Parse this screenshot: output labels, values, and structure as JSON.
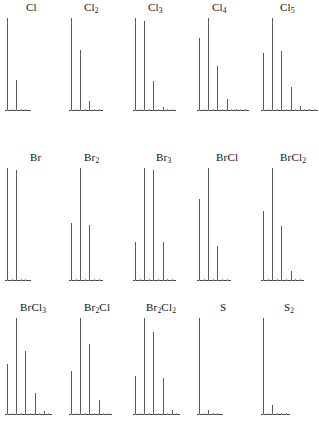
{
  "figure": {
    "title_visible": false,
    "panel_count": 15,
    "grid": {
      "rows": 3,
      "columns": 5
    }
  },
  "chart_data": {
    "type": "bar",
    "title": "",
    "subtitle": "",
    "xlabel": "",
    "ylabel": "",
    "grid": false,
    "legend": "none",
    "axis_ranges": {
      "y": [
        0,
        100
      ]
    },
    "panels": [
      {
        "label": "Cl",
        "label_formula": "Cl",
        "row": 0,
        "column": 0,
        "categories": [
          "M",
          "M+2"
        ],
        "values": [
          100,
          33
        ],
        "stick_positions": [
          0,
          2
        ],
        "axis_ticks": 5
      },
      {
        "label": "Cl2",
        "label_formula": "Cl₂",
        "row": 0,
        "column": 1,
        "categories": [
          "M",
          "M+2",
          "M+4"
        ],
        "values": [
          100,
          65,
          10
        ],
        "stick_positions": [
          0,
          2,
          4
        ],
        "axis_ticks": 7
      },
      {
        "label": "Cl3",
        "label_formula": "Cl₃",
        "row": 0,
        "column": 2,
        "categories": [
          "M",
          "M+2",
          "M+4",
          "M+6"
        ],
        "values": [
          100,
          97,
          32,
          3
        ],
        "stick_positions": [
          0,
          2,
          4,
          6
        ],
        "axis_ticks": 9
      },
      {
        "label": "Cl4",
        "label_formula": "Cl₄",
        "row": 0,
        "column": 3,
        "categories": [
          "M",
          "M+2",
          "M+4",
          "M+6",
          "M+8"
        ],
        "values": [
          78,
          100,
          48,
          12,
          1
        ],
        "stick_positions": [
          0,
          2,
          4,
          6,
          8
        ],
        "axis_ticks": 11
      },
      {
        "label": "Cl5",
        "label_formula": "Cl₅",
        "row": 0,
        "column": 4,
        "categories": [
          "M",
          "M+2",
          "M+4",
          "M+6",
          "M+8",
          "M+10"
        ],
        "values": [
          62,
          100,
          64,
          25,
          4,
          1
        ],
        "stick_positions": [
          0,
          2,
          4,
          6,
          8,
          10
        ],
        "axis_ticks": 12
      },
      {
        "label": "Br",
        "label_formula": "Br",
        "row": 1,
        "column": 0,
        "categories": [
          "M",
          "M+2"
        ],
        "values": [
          100,
          98
        ],
        "stick_positions": [
          0,
          2
        ],
        "axis_ticks": 5
      },
      {
        "label": "Br2",
        "label_formula": "Br₂",
        "row": 1,
        "column": 1,
        "categories": [
          "M",
          "M+2",
          "M+4"
        ],
        "values": [
          51,
          100,
          49
        ],
        "stick_positions": [
          0,
          2,
          4
        ],
        "axis_ticks": 7
      },
      {
        "label": "Br3",
        "label_formula": "Br₃",
        "row": 1,
        "column": 2,
        "categories": [
          "M",
          "M+2",
          "M+4",
          "M+6"
        ],
        "values": [
          34,
          100,
          98,
          34
        ],
        "stick_positions": [
          0,
          2,
          4,
          6
        ],
        "axis_ticks": 9
      },
      {
        "label": "BrCl",
        "label_formula": "BrCl",
        "row": 1,
        "column": 3,
        "categories": [
          "M",
          "M+2",
          "M+4"
        ],
        "values": [
          72,
          100,
          30
        ],
        "stick_positions": [
          0,
          2,
          4
        ],
        "axis_ticks": 7
      },
      {
        "label": "BrCl2",
        "label_formula": "BrCl₂",
        "row": 1,
        "column": 4,
        "categories": [
          "M",
          "M+2",
          "M+4",
          "M+6"
        ],
        "values": [
          62,
          100,
          48,
          8
        ],
        "stick_positions": [
          0,
          2,
          4,
          6
        ],
        "axis_ticks": 9
      },
      {
        "label": "BrCl3",
        "label_formula": "BrCl₃",
        "row": 2,
        "column": 0,
        "categories": [
          "M",
          "M+2",
          "M+4",
          "M+6",
          "M+8"
        ],
        "values": [
          52,
          100,
          66,
          22,
          3
        ],
        "stick_positions": [
          0,
          2,
          4,
          6,
          8
        ],
        "axis_ticks": 10
      },
      {
        "label": "Br2Cl",
        "label_formula": "Br₂Cl",
        "row": 2,
        "column": 1,
        "categories": [
          "M",
          "M+2",
          "M+4",
          "M+6"
        ],
        "values": [
          45,
          100,
          73,
          15
        ],
        "stick_positions": [
          0,
          2,
          4,
          6
        ],
        "axis_ticks": 9
      },
      {
        "label": "Br2Cl2",
        "label_formula": "Br₂Cl₂",
        "row": 2,
        "column": 2,
        "categories": [
          "M",
          "M+2",
          "M+4",
          "M+6",
          "M+8"
        ],
        "values": [
          40,
          100,
          85,
          38,
          4
        ],
        "stick_positions": [
          0,
          2,
          4,
          6,
          8
        ],
        "axis_ticks": 10
      },
      {
        "label": "S",
        "label_formula": "S",
        "row": 2,
        "column": 3,
        "categories": [
          "M",
          "M+2"
        ],
        "values": [
          100,
          4
        ],
        "stick_positions": [
          0,
          2
        ],
        "axis_ticks": 5
      },
      {
        "label": "S2",
        "label_formula": "S₂",
        "row": 2,
        "column": 4,
        "categories": [
          "M",
          "M+2"
        ],
        "values": [
          100,
          9
        ],
        "stick_positions": [
          0,
          2
        ],
        "axis_ticks": 6
      }
    ]
  },
  "style": {
    "peak_color": "#5a5a5a",
    "axis_color": "#4a4a4a",
    "tick_color": "#8c8c8c",
    "label_color": "#111111",
    "background": "#ffffff"
  }
}
